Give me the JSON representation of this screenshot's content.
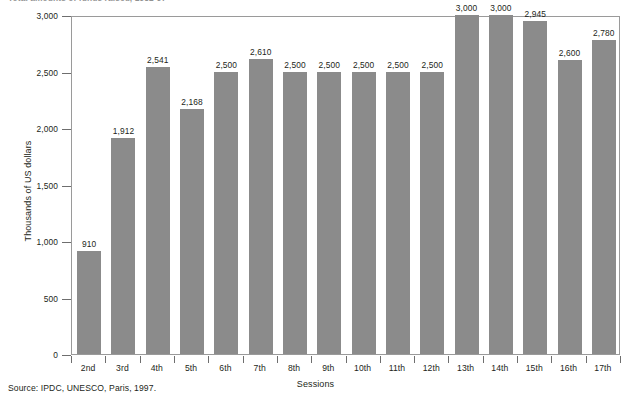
{
  "figure": {
    "title": "Total amounts of funds raised, 1982-97",
    "source": "Source: IPDC, UNESCO, Paris, 1997."
  },
  "chart_data": {
    "type": "bar",
    "title": "Total amounts of funds raised, 1982-97",
    "xlabel": "Sessions",
    "ylabel": "Thousands of US dollars",
    "categories": [
      "2nd",
      "3rd",
      "4th",
      "5th",
      "6th",
      "7th",
      "8th",
      "9th",
      "10th",
      "11th",
      "12th",
      "13th",
      "14th",
      "15th",
      "16th",
      "17th"
    ],
    "values": [
      910,
      1912,
      2541,
      2168,
      2500,
      2610,
      2500,
      2500,
      2500,
      2500,
      2500,
      3000,
      3000,
      2945,
      2600,
      2780
    ],
    "value_labels": [
      "910",
      "1,912",
      "2,541",
      "2,168",
      "2,500",
      "2,610",
      "2,500",
      "2,500",
      "2,500",
      "2,500",
      "2,500",
      "3,000",
      "3,000",
      "2,945",
      "2,600",
      "2,780"
    ],
    "ylim": [
      0,
      3000
    ],
    "yticks": [
      0,
      500,
      1000,
      1500,
      2000,
      2500,
      3000
    ],
    "ytick_labels": [
      "0",
      "500",
      "1,000",
      "1,500",
      "2,000",
      "2,500",
      "3,000"
    ],
    "grid": false,
    "legend": "none",
    "bar_color": "#8b8b8b",
    "frame_color": "#9a9a9a",
    "background": "#ffffff"
  }
}
